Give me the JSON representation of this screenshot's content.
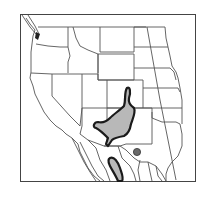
{
  "map": {
    "type": "species range map",
    "region": "Western United States and northern Mexico",
    "colors": {
      "background": "#ffffff",
      "border_line": "#555555",
      "frame": "#444444",
      "range_fill": "#b8b8b8",
      "range_outline": "#1a1a1a",
      "point_fill": "#6a6a6a"
    },
    "ranges": [
      {
        "name": "main-range",
        "description": "Grey-filled range across central Arizona, western New Mexico extending north into southwestern Colorado"
      },
      {
        "name": "southern-range",
        "description": "Elongated range along the Sierra Madre Occidental, Mexico"
      },
      {
        "name": "disjunct-point",
        "description": "Isolated locality dot in northern Mexico (Chihuahua / Coahuila)"
      }
    ]
  }
}
